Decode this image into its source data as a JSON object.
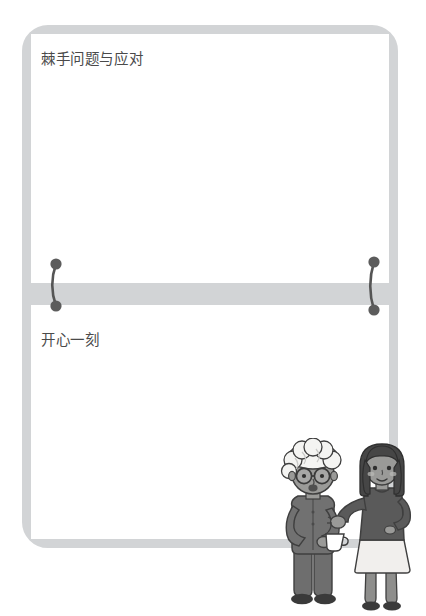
{
  "page": {
    "background_color": "#ffffff",
    "width": 426,
    "height": 616
  },
  "frame": {
    "border_color": "#d2d4d6",
    "fill_color": "#ffffff",
    "corner_radius": "26px"
  },
  "divider": {
    "band_color": "#d2d4d6",
    "ring_color": "#595959",
    "ring_count": 2,
    "ring_positions": [
      "left",
      "right"
    ]
  },
  "sections": [
    {
      "id": "section-top",
      "label": "棘手问题与应对",
      "label_color": "#4a4a4a",
      "body_text": ""
    },
    {
      "id": "section-bottom",
      "label": "开心一刻",
      "label_color": "#4a4a4a",
      "body_text": ""
    }
  ],
  "illustration": {
    "name": "two-people-conversation-illustration",
    "figures": [
      {
        "id": "elderly-figure",
        "description": "elderly person with white curly hair and round glasses holding a cup",
        "hair_color": "#f2f2f0",
        "skin_color": "#9a9a98",
        "outfit_color": "#6e6e6e",
        "accessory": "cup",
        "accessory_color": "#ffffff"
      },
      {
        "id": "young-woman-figure",
        "description": "young woman with dark bob hair, dark top and light skirt, gesturing with hand",
        "hair_color": "#4a4a4a",
        "skin_color": "#9a9a98",
        "top_color": "#5a5a5a",
        "skirt_color": "#f0eeec",
        "legs_color": "#8e8e8c"
      }
    ]
  }
}
